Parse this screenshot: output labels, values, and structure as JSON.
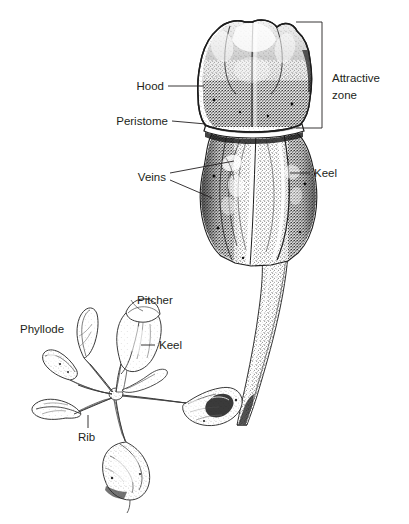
{
  "figure": {
    "background_color": "#ffffff",
    "ink_color": "#231f20",
    "style": "black-and-white stippled botanical line drawing"
  },
  "labels": {
    "hood": "Hood",
    "peristome": "Peristome",
    "veins": "Veins",
    "keel_upper": "Keel",
    "attractive_zone_line1": "Attractive",
    "attractive_zone_line2": "zone",
    "pitcher": "Pitcher",
    "phyllode": "Phyllode",
    "keel_lower": "Keel",
    "rib": "Rib"
  },
  "caption": {
    "text": ""
  }
}
